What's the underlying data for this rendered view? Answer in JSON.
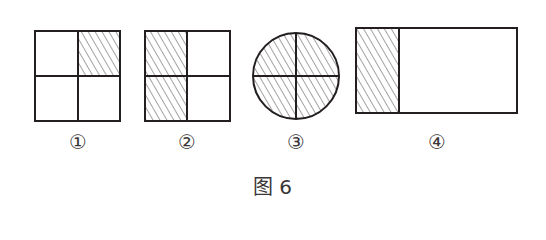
{
  "figure": {
    "caption": "图 6",
    "shapes": [
      {
        "id": 1,
        "label": "①",
        "shape": "square",
        "divisions": 4,
        "shaded": 1,
        "shaded_part": "top-right quarter"
      },
      {
        "id": 2,
        "label": "②",
        "shape": "square",
        "divisions": 4,
        "shaded": 2,
        "shaded_part": "left half (two quarters)"
      },
      {
        "id": 3,
        "label": "③",
        "shape": "circle",
        "divisions": 4,
        "shaded": 4,
        "shaded_part": "entire circle"
      },
      {
        "id": 4,
        "label": "④",
        "shape": "rectangle",
        "divisions": 0,
        "shaded": 1,
        "shaded_part": "left strip"
      }
    ],
    "colors": {
      "stroke": "#231f20",
      "hatch": "#555555",
      "background": "#ffffff"
    }
  }
}
